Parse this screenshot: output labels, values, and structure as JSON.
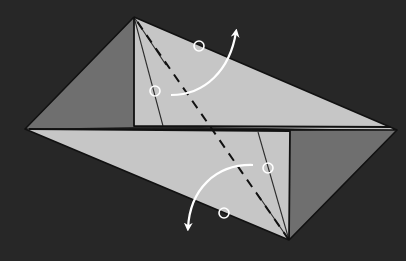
{
  "diagram": {
    "type": "origami-fold-step",
    "canvas": {
      "width": 406,
      "height": 261
    },
    "colors": {
      "background": "#2f2f2f",
      "paper_light": "#c6c6c6",
      "paper_dark": "#6f6f6f",
      "edge": "#111111",
      "annotation": "#ffffff"
    },
    "vertices": {
      "top": [
        134,
        17
      ],
      "left": [
        25,
        129
      ],
      "right": [
        397,
        130
      ],
      "bottom": [
        289,
        240
      ]
    },
    "panels": {
      "upper_dark_triangle": "top-left-inner",
      "lower_dark_triangle": "right-bottom-inner",
      "upper_inner_corner": [
        134,
        126
      ],
      "lower_inner_corner": [
        290,
        132
      ]
    },
    "valley_fold_line": {
      "from": [
        134,
        17
      ],
      "to": [
        289,
        240
      ],
      "style": "dashed"
    },
    "crease_lines": [
      {
        "from": [
          134,
          17
        ],
        "to": [
          163,
          126
        ]
      },
      {
        "from": [
          134,
          17
        ],
        "to": [
          166,
          65
        ]
      },
      {
        "from": [
          289,
          240
        ],
        "to": [
          258,
          132
        ]
      },
      {
        "from": [
          289,
          240
        ],
        "to": [
          256,
          192
        ]
      }
    ],
    "reference_circles": [
      {
        "cx": 199,
        "cy": 46,
        "r": 5
      },
      {
        "cx": 155,
        "cy": 91,
        "r": 5
      },
      {
        "cx": 268,
        "cy": 168,
        "r": 5
      },
      {
        "cx": 224,
        "cy": 213,
        "r": 5
      }
    ],
    "arrows": [
      {
        "label": "fold-up",
        "from": [
          171,
          95
        ],
        "to": [
          236,
          32
        ],
        "direction": "up"
      },
      {
        "label": "fold-down",
        "from": [
          253,
          165
        ],
        "to": [
          188,
          228
        ],
        "direction": "down"
      }
    ]
  }
}
